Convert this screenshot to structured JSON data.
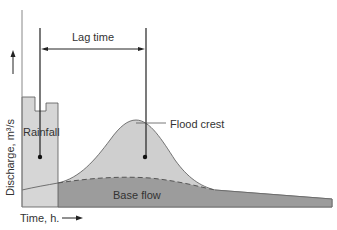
{
  "diagram": {
    "type": "hydrograph",
    "labels": {
      "lag_time": "Lag time",
      "rainfall": "Rainfall",
      "flood_crest": "Flood crest",
      "base_flow": "Base flow",
      "y_axis": "Discharge, m³/s",
      "x_axis": "Time, h."
    },
    "colors": {
      "rainfall_fill": "#d4d4d4",
      "storm_flow_fill": "#c8c8c8",
      "base_flow_fill": "#9a9a9a",
      "outline": "#555555",
      "line": "#222222"
    }
  }
}
